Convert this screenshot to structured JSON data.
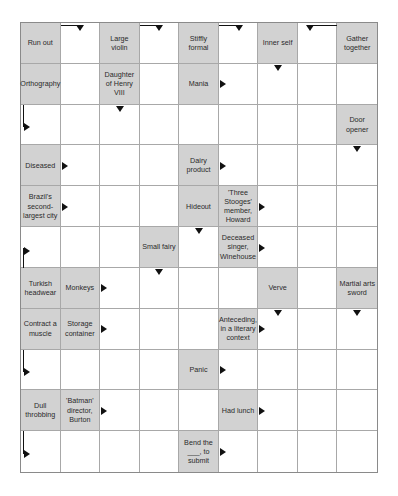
{
  "puzzle": {
    "type": "arrowword",
    "columns": 9,
    "rows": 11,
    "colors": {
      "clue_bg": "#d2d2d2",
      "cell_bg": "#ffffff",
      "grid_line": "#a8a8a8",
      "arrow": "#111111"
    },
    "clues": [
      {
        "r": 0,
        "c": 0,
        "text": "Run out"
      },
      {
        "r": 0,
        "c": 2,
        "text": "Large violin"
      },
      {
        "r": 0,
        "c": 4,
        "text": "Stiffly formal"
      },
      {
        "r": 0,
        "c": 6,
        "text": "Inner self"
      },
      {
        "r": 0,
        "c": 8,
        "text": "Gather together"
      },
      {
        "r": 1,
        "c": 0,
        "text": "Orthography"
      },
      {
        "r": 1,
        "c": 2,
        "text": "Daughter of Henry VIII"
      },
      {
        "r": 1,
        "c": 4,
        "text": "Mania"
      },
      {
        "r": 2,
        "c": 8,
        "text": "Door opener"
      },
      {
        "r": 3,
        "c": 0,
        "text": "Diseased"
      },
      {
        "r": 3,
        "c": 4,
        "text": "Dairy product"
      },
      {
        "r": 4,
        "c": 0,
        "text": "Brazil's second-largest city"
      },
      {
        "r": 4,
        "c": 4,
        "text": "Hideout"
      },
      {
        "r": 4,
        "c": 5,
        "text": "'Three Stooges' member, Howard"
      },
      {
        "r": 5,
        "c": 3,
        "text": "Small fairy"
      },
      {
        "r": 5,
        "c": 5,
        "text": "Deceased singer, Winehouse"
      },
      {
        "r": 6,
        "c": 0,
        "text": "Turkish headwear"
      },
      {
        "r": 6,
        "c": 1,
        "text": "Monkeys"
      },
      {
        "r": 6,
        "c": 6,
        "text": "Verve"
      },
      {
        "r": 6,
        "c": 8,
        "text": "Martial arts sword"
      },
      {
        "r": 7,
        "c": 0,
        "text": "Contract a muscle"
      },
      {
        "r": 7,
        "c": 1,
        "text": "Storage container"
      },
      {
        "r": 7,
        "c": 5,
        "text": "Anteceding, in a literary context"
      },
      {
        "r": 8,
        "c": 4,
        "text": "Panic"
      },
      {
        "r": 9,
        "c": 0,
        "text": "Dull throbbing"
      },
      {
        "r": 9,
        "c": 1,
        "text": "'Batman' director, Burton"
      },
      {
        "r": 9,
        "c": 5,
        "text": "Had lunch"
      },
      {
        "r": 10,
        "c": 4,
        "text": "Bend the ___, to submit"
      }
    ],
    "arrows": [
      {
        "r": 0,
        "c": 1,
        "kind": "hook-down-right",
        "note": "line from left edge, down arrow at right"
      },
      {
        "r": 0,
        "c": 3,
        "kind": "hook-down-right"
      },
      {
        "r": 0,
        "c": 5,
        "kind": "hook-down-right"
      },
      {
        "r": 0,
        "c": 7,
        "kind": "hook-down-left"
      },
      {
        "r": 1,
        "c": 4,
        "kind": "right"
      },
      {
        "r": 1,
        "c": 6,
        "kind": "down-top"
      },
      {
        "r": 2,
        "c": 0,
        "kind": "l-down-right"
      },
      {
        "r": 2,
        "c": 2,
        "kind": "down-top"
      },
      {
        "r": 3,
        "c": 0,
        "kind": "right"
      },
      {
        "r": 3,
        "c": 4,
        "kind": "right"
      },
      {
        "r": 3,
        "c": 8,
        "kind": "down-top"
      },
      {
        "r": 4,
        "c": 0,
        "kind": "right"
      },
      {
        "r": 4,
        "c": 5,
        "kind": "right"
      },
      {
        "r": 5,
        "c": 0,
        "kind": "l-up-right"
      },
      {
        "r": 5,
        "c": 4,
        "kind": "down-top"
      },
      {
        "r": 5,
        "c": 5,
        "kind": "right"
      },
      {
        "r": 6,
        "c": 1,
        "kind": "right"
      },
      {
        "r": 6,
        "c": 3,
        "kind": "down-top"
      },
      {
        "r": 7,
        "c": 1,
        "kind": "right"
      },
      {
        "r": 7,
        "c": 5,
        "kind": "right"
      },
      {
        "r": 7,
        "c": 6,
        "kind": "down-top"
      },
      {
        "r": 7,
        "c": 8,
        "kind": "down-top"
      },
      {
        "r": 8,
        "c": 0,
        "kind": "l-down-right"
      },
      {
        "r": 8,
        "c": 4,
        "kind": "right"
      },
      {
        "r": 9,
        "c": 1,
        "kind": "right"
      },
      {
        "r": 9,
        "c": 5,
        "kind": "right"
      },
      {
        "r": 10,
        "c": 0,
        "kind": "l-down-right"
      },
      {
        "r": 10,
        "c": 4,
        "kind": "right"
      }
    ]
  }
}
